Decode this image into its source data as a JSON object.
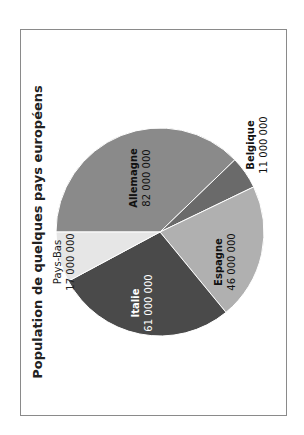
{
  "chart_data": {
    "type": "pie",
    "title": "Population de quelques pays européens",
    "orientation": "rotated 90° counter-clockwise",
    "categories": [
      "Allemagne",
      "Belgique",
      "Espagne",
      "Italie",
      "Pays-Bas"
    ],
    "values": [
      82000000,
      11000000,
      46000000,
      61000000,
      17000000
    ],
    "value_labels": [
      "82 000 000",
      "11 000 000",
      "46 000 000",
      "61 000 000",
      "17 000 000"
    ],
    "colors": [
      "#8a8a8a",
      "#6a6a6a",
      "#b0b0b0",
      "#4a4a4a",
      "#e6e6e6"
    ],
    "legend": "none (labels on/near slices)"
  },
  "title": "Population de quelques pays européens",
  "slices": [
    {
      "name": "Allemagne",
      "value": "82 000 000"
    },
    {
      "name": "Belgique",
      "value": "11 000 000"
    },
    {
      "name": "Espagne",
      "value": "46 000 000"
    },
    {
      "name": "Italie",
      "value": "61 000 000"
    },
    {
      "name": "Pays-Bas",
      "value": "17 000 000"
    }
  ]
}
